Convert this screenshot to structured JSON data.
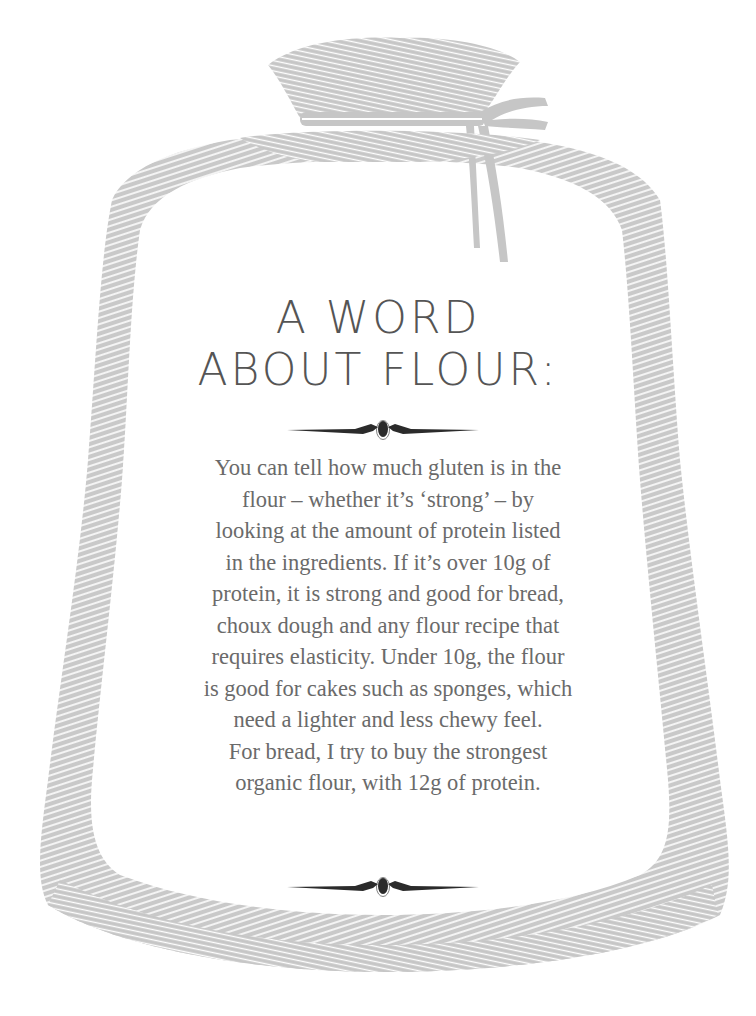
{
  "illustration": {
    "subject": "flour-sack",
    "fill_color": "#c8c8c8",
    "hatch_color": "#ffffff"
  },
  "heading": {
    "line1": "A WORD",
    "line2": "ABOUT FLOUR:"
  },
  "ornament": {
    "name": "ornamental-divider",
    "color": "#2b2b2b"
  },
  "body": {
    "lines": [
      "You can tell how much gluten is in the",
      "flour – whether it’s ‘strong’ – by",
      "looking at the amount of protein listed",
      "in the ingredients. If it’s over 10g of",
      "protein, it is strong and good for bread,",
      "choux dough and any flour recipe that",
      "requires elasticity. Under 10g, the flour",
      "is good for cakes such as sponges, which",
      "need a lighter and less chewy feel.",
      "For bread, I try to buy the strongest",
      "organic flour, with 12g of protein."
    ]
  },
  "colors": {
    "heading": "#555555",
    "body": "#6a6a6a",
    "background": "#ffffff"
  }
}
